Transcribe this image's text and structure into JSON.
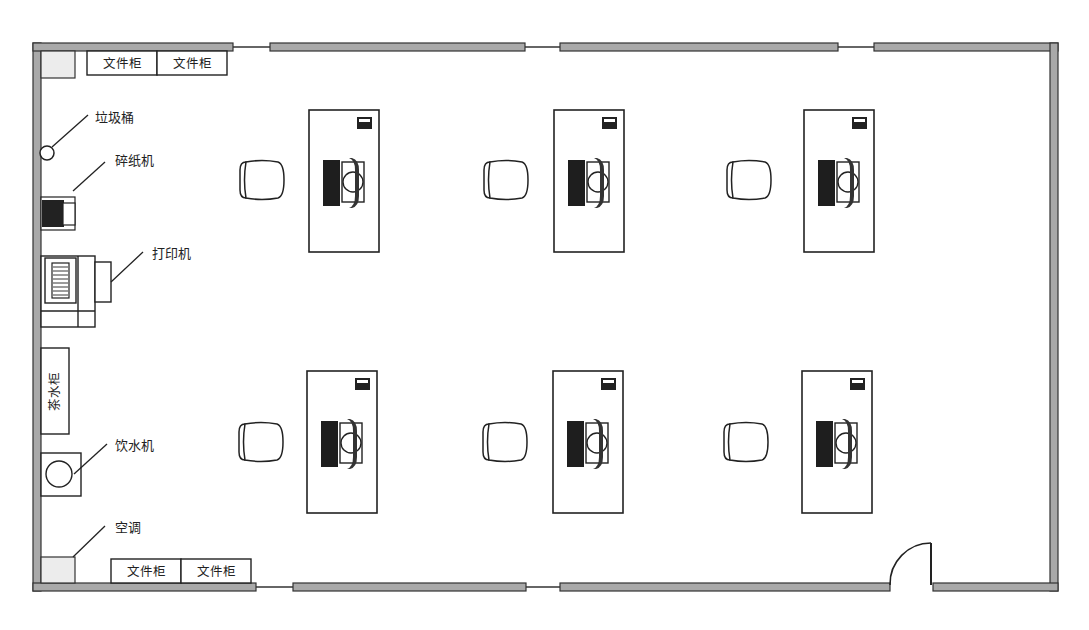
{
  "floorplan": {
    "type": "office floor plan",
    "colors": {
      "wall_fill": "#a9a9a9",
      "wall_stroke": "#333333",
      "fixture_fill": "#ececec",
      "line": "#222222",
      "background": "#ffffff"
    },
    "labels": {
      "trash_bin": "垃圾桶",
      "shredder": "碎纸机",
      "printer": "打印机",
      "tea_cabinet": "茶水柜",
      "water_dispenser": "饮水机",
      "air_conditioner": "空调",
      "file_cabinet": "文件柜"
    },
    "file_cabinets_top": [
      "文件柜",
      "文件柜"
    ],
    "file_cabinets_bottom": [
      "文件柜",
      "文件柜"
    ],
    "workstations": [
      {
        "row": 1,
        "col": 1
      },
      {
        "row": 1,
        "col": 2
      },
      {
        "row": 1,
        "col": 3
      },
      {
        "row": 2,
        "col": 1
      },
      {
        "row": 2,
        "col": 2
      },
      {
        "row": 2,
        "col": 3
      }
    ]
  }
}
